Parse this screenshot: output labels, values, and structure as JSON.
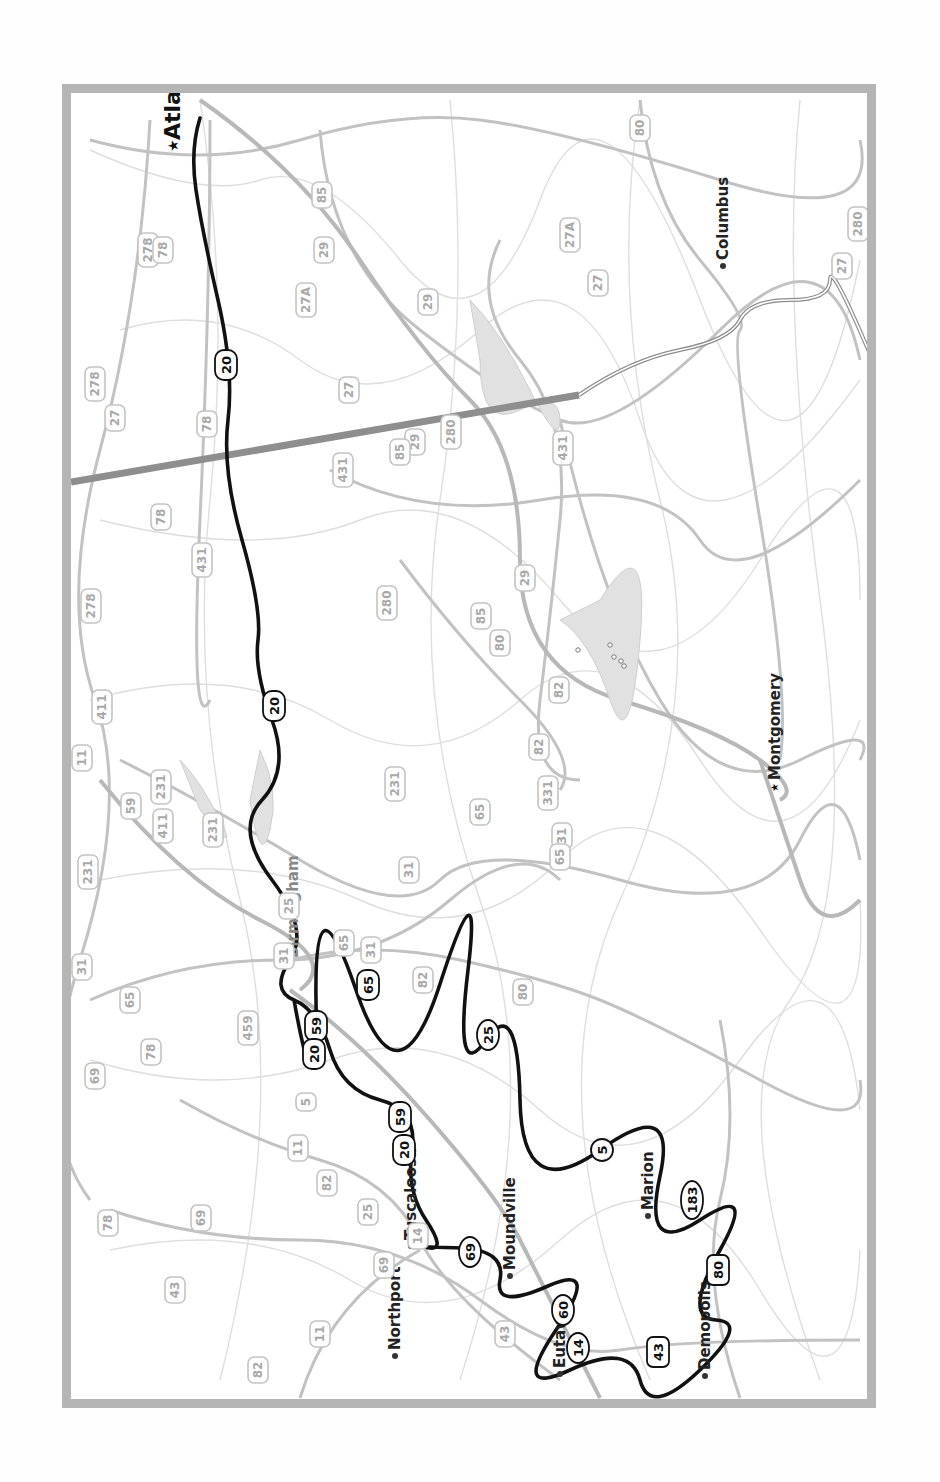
{
  "map": {
    "orientation": "rotated-90-clockwise",
    "route_color": "#111111",
    "frame_color": "#b5b5b5",
    "cities": [
      {
        "name": "Atlanta",
        "x": 180,
        "y": 140,
        "style": "big",
        "marker": "star"
      },
      {
        "name": "Columbus",
        "x": 728,
        "y": 260,
        "style": "normal",
        "marker": "dot"
      },
      {
        "name": "Birmingham",
        "x": 298,
        "y": 958,
        "style": "gray",
        "marker": "none"
      },
      {
        "name": "Montgomery",
        "x": 780,
        "y": 780,
        "style": "normal",
        "marker": "star-small"
      },
      {
        "name": "Tuscaloosa",
        "x": 416,
        "y": 1240,
        "style": "normal",
        "marker": "dot"
      },
      {
        "name": "Northport",
        "x": 400,
        "y": 1350,
        "style": "normal",
        "marker": "dot"
      },
      {
        "name": "Moundville",
        "x": 515,
        "y": 1270,
        "style": "normal",
        "marker": "dot"
      },
      {
        "name": "Marion",
        "x": 653,
        "y": 1210,
        "style": "normal",
        "marker": "dot"
      },
      {
        "name": "Eutaw",
        "x": 565,
        "y": 1368,
        "style": "normal",
        "marker": "dot"
      },
      {
        "name": "Demopolis",
        "x": 710,
        "y": 1370,
        "style": "normal",
        "marker": "dot"
      }
    ],
    "route_shields": [
      {
        "label": "20",
        "type": "interstate",
        "x": 226,
        "y": 365
      },
      {
        "label": "20",
        "type": "interstate",
        "x": 274,
        "y": 706
      },
      {
        "label": "65",
        "type": "interstate",
        "x": 368,
        "y": 985
      },
      {
        "label": "59",
        "type": "interstate",
        "x": 316,
        "y": 1026
      },
      {
        "label": "20",
        "type": "interstate",
        "x": 314,
        "y": 1054
      },
      {
        "label": "59",
        "type": "interstate",
        "x": 400,
        "y": 1117
      },
      {
        "label": "20",
        "type": "interstate",
        "x": 404,
        "y": 1150
      },
      {
        "label": "25",
        "type": "state",
        "x": 488,
        "y": 1035
      },
      {
        "label": "5",
        "type": "state",
        "x": 602,
        "y": 1150
      },
      {
        "label": "183",
        "type": "state",
        "x": 692,
        "y": 1200
      },
      {
        "label": "69",
        "type": "state",
        "x": 470,
        "y": 1252
      },
      {
        "label": "60",
        "type": "state",
        "x": 563,
        "y": 1310
      },
      {
        "label": "14",
        "type": "state",
        "x": 578,
        "y": 1348
      },
      {
        "label": "43",
        "type": "us",
        "x": 658,
        "y": 1352
      },
      {
        "label": "80",
        "type": "us",
        "x": 718,
        "y": 1270
      }
    ],
    "background_shields": [
      {
        "label": "80",
        "x": 640,
        "y": 128
      },
      {
        "label": "85",
        "x": 322,
        "y": 195
      },
      {
        "label": "278",
        "x": 148,
        "y": 250
      },
      {
        "label": "78",
        "x": 163,
        "y": 250
      },
      {
        "label": "27A",
        "x": 570,
        "y": 235
      },
      {
        "label": "29",
        "x": 324,
        "y": 250
      },
      {
        "label": "280",
        "x": 858,
        "y": 224
      },
      {
        "label": "27",
        "x": 842,
        "y": 266
      },
      {
        "label": "27",
        "x": 598,
        "y": 283
      },
      {
        "label": "27A",
        "x": 306,
        "y": 300
      },
      {
        "label": "29",
        "x": 428,
        "y": 302
      },
      {
        "label": "27",
        "x": 349,
        "y": 390
      },
      {
        "label": "278",
        "x": 95,
        "y": 384
      },
      {
        "label": "27",
        "x": 115,
        "y": 418
      },
      {
        "label": "78",
        "x": 207,
        "y": 424
      },
      {
        "label": "29",
        "x": 415,
        "y": 442
      },
      {
        "label": "280",
        "x": 451,
        "y": 432
      },
      {
        "label": "85",
        "x": 400,
        "y": 452
      },
      {
        "label": "431",
        "x": 563,
        "y": 448
      },
      {
        "label": "431",
        "x": 343,
        "y": 470
      },
      {
        "label": "78",
        "x": 161,
        "y": 517
      },
      {
        "label": "431",
        "x": 202,
        "y": 560
      },
      {
        "label": "278",
        "x": 91,
        "y": 606
      },
      {
        "label": "280",
        "x": 387,
        "y": 603
      },
      {
        "label": "85",
        "x": 481,
        "y": 616
      },
      {
        "label": "80",
        "x": 500,
        "y": 643
      },
      {
        "label": "29",
        "x": 525,
        "y": 578
      },
      {
        "label": "82",
        "x": 559,
        "y": 690
      },
      {
        "label": "411",
        "x": 102,
        "y": 707
      },
      {
        "label": "11",
        "x": 82,
        "y": 758
      },
      {
        "label": "82",
        "x": 539,
        "y": 747
      },
      {
        "label": "59",
        "x": 131,
        "y": 806
      },
      {
        "label": "231",
        "x": 161,
        "y": 787
      },
      {
        "label": "231",
        "x": 395,
        "y": 784
      },
      {
        "label": "411",
        "x": 163,
        "y": 826
      },
      {
        "label": "231",
        "x": 213,
        "y": 830
      },
      {
        "label": "331",
        "x": 548,
        "y": 793
      },
      {
        "label": "65",
        "x": 480,
        "y": 812
      },
      {
        "label": "31",
        "x": 562,
        "y": 836
      },
      {
        "label": "65",
        "x": 560,
        "y": 857
      },
      {
        "label": "231",
        "x": 88,
        "y": 872
      },
      {
        "label": "31",
        "x": 409,
        "y": 870
      },
      {
        "label": "25",
        "x": 289,
        "y": 906
      },
      {
        "label": "65",
        "x": 344,
        "y": 943
      },
      {
        "label": "31",
        "x": 284,
        "y": 956
      },
      {
        "label": "31",
        "x": 371,
        "y": 950
      },
      {
        "label": "82",
        "x": 423,
        "y": 980
      },
      {
        "label": "80",
        "x": 523,
        "y": 992
      },
      {
        "label": "31",
        "x": 82,
        "y": 967
      },
      {
        "label": "65",
        "x": 130,
        "y": 1000
      },
      {
        "label": "459",
        "x": 248,
        "y": 1028
      },
      {
        "label": "78",
        "x": 151,
        "y": 1052
      },
      {
        "label": "69",
        "x": 95,
        "y": 1076
      },
      {
        "label": "5",
        "x": 306,
        "y": 1102
      },
      {
        "label": "11",
        "x": 298,
        "y": 1148
      },
      {
        "label": "82",
        "x": 327,
        "y": 1183
      },
      {
        "label": "69",
        "x": 201,
        "y": 1218
      },
      {
        "label": "25",
        "x": 368,
        "y": 1212
      },
      {
        "label": "78",
        "x": 108,
        "y": 1223
      },
      {
        "label": "14",
        "x": 418,
        "y": 1236
      },
      {
        "label": "69",
        "x": 384,
        "y": 1265
      },
      {
        "label": "43",
        "x": 175,
        "y": 1290
      },
      {
        "label": "11",
        "x": 320,
        "y": 1334
      },
      {
        "label": "43",
        "x": 505,
        "y": 1334
      },
      {
        "label": "82",
        "x": 258,
        "y": 1370
      }
    ],
    "lake_dots": [
      {
        "x": 578,
        "y": 650
      },
      {
        "x": 610,
        "y": 645
      },
      {
        "x": 614,
        "y": 657
      },
      {
        "x": 621,
        "y": 661
      },
      {
        "x": 624,
        "y": 666
      }
    ]
  }
}
